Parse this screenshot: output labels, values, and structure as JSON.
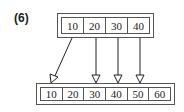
{
  "label": "(6)",
  "parent_node": {
    "keys": [
      "10",
      "20",
      "30",
      "40"
    ]
  },
  "child_node": {
    "keys": [
      "10",
      "20",
      "30",
      "40",
      "50",
      "60"
    ]
  },
  "edges": [
    {
      "from": "parent.10",
      "to": "child.10"
    },
    {
      "from": "parent.20",
      "to": "child.30"
    },
    {
      "from": "parent.30",
      "to": "child.40"
    },
    {
      "from": "parent.40",
      "to": "child.50"
    }
  ]
}
